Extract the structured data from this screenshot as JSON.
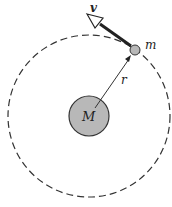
{
  "diagram": {
    "labels": {
      "velocity": "v",
      "small_mass": "m",
      "radius": "r",
      "central_mass": "M"
    },
    "colors": {
      "mass_fill": "#b8b8b8",
      "stroke": "#333333",
      "background": "#ffffff"
    },
    "orbit": {
      "cx": 89,
      "cy": 116,
      "r": 81,
      "style": "dashed"
    },
    "central_body": {
      "cx": 89,
      "cy": 116,
      "r": 20
    },
    "orbiting_body": {
      "cx": 135,
      "cy": 50,
      "r": 5
    }
  }
}
